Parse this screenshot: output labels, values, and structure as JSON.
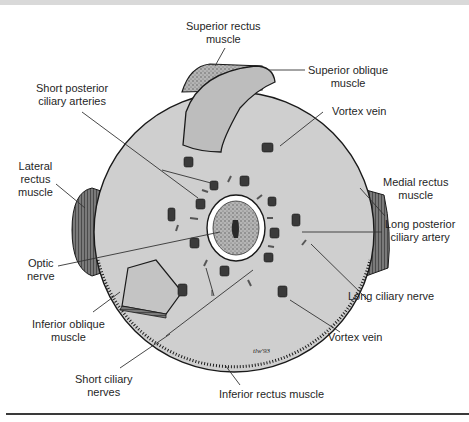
{
  "figure": {
    "signature": "tlw'93",
    "colors": {
      "globe_fill": "#cfcfcf",
      "outline": "#1a1a1a",
      "muscle_dark": "#3d3d3d",
      "muscle_light": "#b8b8b8",
      "label_text": "#1f1f1f",
      "leader_line": "#333333"
    }
  },
  "labels": {
    "superior_rectus": [
      "Superior rectus",
      "muscle"
    ],
    "superior_oblique": [
      "Superior oblique",
      "muscle"
    ],
    "short_posterior_ciliary_arteries": [
      "Short posterior",
      "ciliary arteries"
    ],
    "vortex_vein_top": [
      "Vortex vein"
    ],
    "lateral_rectus": [
      "Lateral",
      "rectus",
      "muscle"
    ],
    "medial_rectus": [
      "Medial rectus",
      "muscle"
    ],
    "long_posterior_ciliary_artery": [
      "Long posterior",
      "ciliary artery"
    ],
    "optic_nerve": [
      "Optic",
      "nerve"
    ],
    "long_ciliary_nerve": [
      "Long ciliary nerve"
    ],
    "inferior_oblique": [
      "Inferior oblique",
      "muscle"
    ],
    "vortex_vein_bottom": [
      "Vortex vein"
    ],
    "short_ciliary_nerves": [
      "Short ciliary",
      "nerves"
    ],
    "inferior_rectus": [
      "Inferior rectus muscle"
    ]
  }
}
